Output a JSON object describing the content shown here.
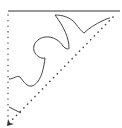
{
  "diagram": {
    "type": "geometric-fold-cut",
    "background": "#ffffff",
    "stroke_color": "#333333",
    "dot_color": "#444444",
    "top_edge": {
      "x1": 8,
      "y1": 11,
      "x2": 120,
      "y2": 11,
      "style": "solid"
    },
    "left_edge": {
      "x1": 8,
      "y1": 15,
      "x2": 8,
      "y2": 118,
      "style": "dotted"
    },
    "diagonal_edge": {
      "x1": 113,
      "y1": 17,
      "x2": 12,
      "y2": 120,
      "style": "dotted"
    },
    "cut_curve": {
      "style": "solid",
      "path": "M9,79 C14,79 17,75 20,77 C24,82 27,87 32,86 C38,84 43,76 45,58 C41,59 36,56 34,51 C32,44 38,38 45,37 C53,36 60,41 63,46 C66,50 70,49 69,48 C69,38 64,27 55,15 C62,15 70,17 75,23 C79,28 82,32 84,33 C89,28 96,24 102,21 C106,19 109,18 110,18"
    },
    "small_cut": {
      "x1": 9,
      "y1": 107,
      "x2": 21,
      "y2": 113,
      "style": "solid"
    },
    "arrow": {
      "x": 9,
      "y": 124,
      "direction": "down-left"
    }
  }
}
